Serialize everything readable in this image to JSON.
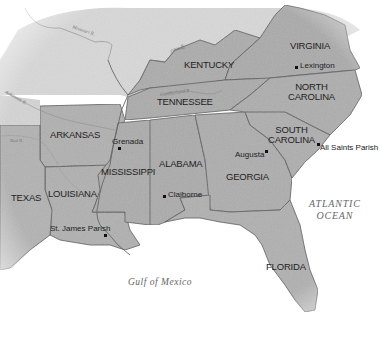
{
  "map": {
    "title": "Southeastern United States",
    "colors": {
      "land_focus": "#aeaeae",
      "land_other": "#d8d8d8",
      "water": "#ffffff",
      "border": "#555555",
      "river": "#777777",
      "text": "#1e1e1e"
    },
    "states": [
      {
        "name": "KENTUCKY"
      },
      {
        "name": "VIRGINIA"
      },
      {
        "name": "TENNESSEE"
      },
      {
        "name": "NORTH CAROLINA",
        "line1": "NORTH",
        "line2": "CAROLINA"
      },
      {
        "name": "ARKANSAS"
      },
      {
        "name": "SOUTH CAROLINA",
        "line1": "SOUTH",
        "line2": "CAROLINA"
      },
      {
        "name": "MISSISSIPPI"
      },
      {
        "name": "ALABAMA"
      },
      {
        "name": "GEORGIA"
      },
      {
        "name": "LOUISIANA"
      },
      {
        "name": "TEXAS"
      },
      {
        "name": "FLORIDA"
      }
    ],
    "cities": [
      {
        "name": "Lexington"
      },
      {
        "name": "Grenada"
      },
      {
        "name": "Augusta"
      },
      {
        "name": "All Saints Parish"
      },
      {
        "name": "Claiborne"
      },
      {
        "name": "St. James Parish"
      }
    ],
    "water_bodies": [
      {
        "name": "ATLANTIC OCEAN",
        "line1": "ATLANTIC",
        "line2": "OCEAN"
      },
      {
        "name": "Gulf of Mexico"
      }
    ],
    "rivers": [
      {
        "name": "Missouri R."
      },
      {
        "name": "Ohio R."
      },
      {
        "name": "Arkansas R."
      },
      {
        "name": "Red R."
      },
      {
        "name": "Cumberland R."
      }
    ]
  }
}
